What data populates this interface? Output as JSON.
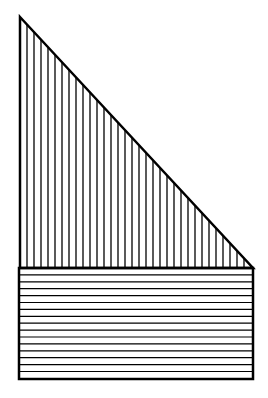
{
  "figure": {
    "stroke_color": "#000000",
    "background_color": "#ffffff",
    "triangle": {
      "apex": [
        20,
        17
      ],
      "bottom_left": [
        20,
        268
      ],
      "bottom_right": [
        253,
        268
      ],
      "hatch": "vertical",
      "hatch_spacing": 7
    },
    "rectangle": {
      "x": 19,
      "y": 268,
      "width": 234,
      "height": 111,
      "hatch": "horizontal",
      "hatch_spacing": 6.9
    }
  }
}
